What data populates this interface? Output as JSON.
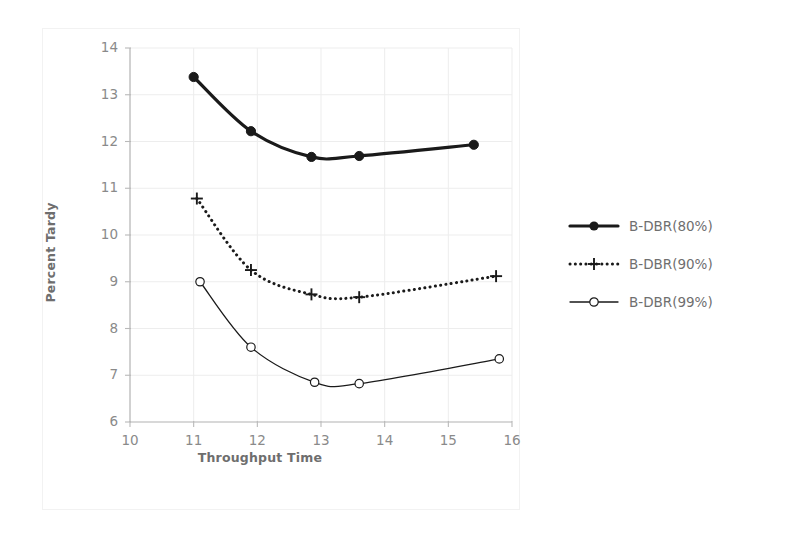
{
  "chart_data": {
    "type": "line",
    "title": "",
    "xlabel": "Throughput Time",
    "ylabel": "Percent Tardy",
    "xlim": [
      10,
      16
    ],
    "ylim": [
      6,
      14
    ],
    "xticks": [
      10,
      11,
      12,
      13,
      14,
      15,
      16
    ],
    "yticks": [
      6,
      7,
      8,
      9,
      10,
      11,
      12,
      13,
      14
    ],
    "grid": true,
    "legend_position": "right",
    "series": [
      {
        "name": "B-DBR(80%)",
        "marker": "filled-circle",
        "line": "solid-thick",
        "color": "#1a1a1a",
        "x": [
          11.0,
          11.9,
          12.85,
          13.6,
          15.4
        ],
        "y": [
          13.38,
          12.22,
          11.67,
          11.69,
          11.93
        ]
      },
      {
        "name": "B-DBR(90%)",
        "marker": "plus",
        "line": "dotted",
        "color": "#1a1a1a",
        "x": [
          11.05,
          11.9,
          12.85,
          13.6,
          15.75
        ],
        "y": [
          10.78,
          9.25,
          8.73,
          8.67,
          9.12
        ]
      },
      {
        "name": "B-DBR(99%)",
        "marker": "open-circle",
        "line": "solid-thin",
        "color": "#1a1a1a",
        "x": [
          11.1,
          11.9,
          12.9,
          13.6,
          15.8
        ],
        "y": [
          9.0,
          7.6,
          6.85,
          6.82,
          7.35
        ]
      }
    ]
  },
  "axes": {
    "x_title": "Throughput Time",
    "y_title": "Percent Tardy",
    "x_tick_labels": [
      "10",
      "11",
      "12",
      "13",
      "14",
      "15",
      "16"
    ],
    "y_tick_labels": [
      "6",
      "7",
      "8",
      "9",
      "10",
      "11",
      "12",
      "13",
      "14"
    ]
  },
  "legend": {
    "entries": [
      {
        "label": "B-DBR(80%)",
        "marker": "filled-circle-icon"
      },
      {
        "label": "B-DBR(90%)",
        "marker": "plus-icon"
      },
      {
        "label": "B-DBR(99%)",
        "marker": "open-circle-icon"
      }
    ]
  },
  "colors": {
    "axis": "#b9b9b9",
    "grid": "#ededed",
    "text": "#8a8a8a",
    "title_text": "#6e6e6e",
    "series": "#1a1a1a",
    "frame": "#f2f2f2",
    "background": "#ffffff"
  }
}
